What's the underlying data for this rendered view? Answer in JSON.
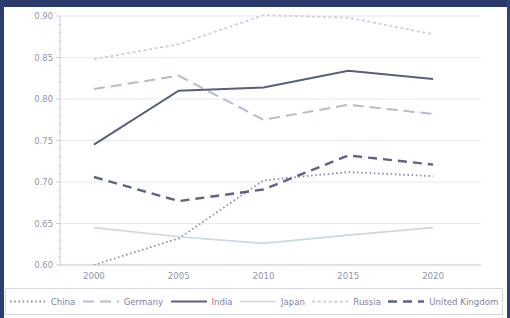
{
  "theme": {
    "frame_color": "#2b3a6b",
    "background": "#ffffff",
    "grid_color": "#e8e9f0",
    "axis_color": "#c9ccda",
    "tick_label_color": "#8f93ad",
    "axis_label_color": "#6a6f92"
  },
  "chart_data": {
    "type": "line",
    "title": "",
    "xlabel": "",
    "ylabel": "Gini  coefficient of wewalth",
    "x": [
      2000,
      2005,
      2010,
      2015,
      2020
    ],
    "xtick_labels": [
      "2000",
      "2005",
      "2010",
      "2015",
      "2020"
    ],
    "ytick_labels": [
      "0.60",
      "0.65",
      "0.70",
      "0.75",
      "0.80",
      "0.85",
      "0.90"
    ],
    "yticks": [
      0.6,
      0.65,
      0.7,
      0.75,
      0.8,
      0.85,
      0.9
    ],
    "xlim": [
      1998,
      2022
    ],
    "ylim": [
      0.6,
      0.9
    ],
    "grid": true,
    "legend_position": "bottom",
    "series": [
      {
        "name": "China",
        "values": [
          0.6,
          0.632,
          0.702,
          0.712,
          0.707
        ],
        "color": "#8d91ad",
        "style": "dotted",
        "dasharray": "1.6 2.6",
        "width": 1.8
      },
      {
        "name": "Germany",
        "values": [
          0.812,
          0.828,
          0.775,
          0.793,
          0.782
        ],
        "color": "#b3bcd0",
        "style": "dashed",
        "dasharray": "11 6",
        "width": 2.0
      },
      {
        "name": "India",
        "values": [
          0.745,
          0.81,
          0.814,
          0.834,
          0.824
        ],
        "color": "#575f80",
        "style": "solid",
        "dasharray": "none",
        "width": 2.0
      },
      {
        "name": "Japan",
        "values": [
          0.645,
          0.634,
          0.626,
          0.636,
          0.645
        ],
        "color": "#ccd6e4",
        "style": "solid",
        "dasharray": "none",
        "width": 1.6
      },
      {
        "name": "Russia",
        "values": [
          0.848,
          0.866,
          0.901,
          0.898,
          0.878
        ],
        "color": "#ccd0dd",
        "style": "dotted",
        "dasharray": "3 2.6",
        "width": 1.8
      },
      {
        "name": "United Kingdom",
        "values": [
          0.706,
          0.677,
          0.691,
          0.732,
          0.721
        ],
        "color": "#5d6486",
        "style": "dashed",
        "dasharray": "9 6",
        "width": 2.4
      }
    ]
  },
  "legend": {
    "items": [
      {
        "label": "China"
      },
      {
        "label": "Germany"
      },
      {
        "label": "India"
      },
      {
        "label": "Japan"
      },
      {
        "label": "Russia"
      },
      {
        "label": "United Kingdom"
      }
    ]
  }
}
